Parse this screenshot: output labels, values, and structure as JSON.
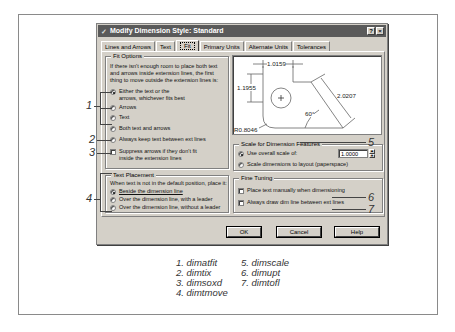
{
  "dialog": {
    "title": "Modify Dimension Style: Standard",
    "title_buttons": [
      "?",
      "×"
    ],
    "tabs": [
      {
        "label": "Lines and Arrows",
        "active": false
      },
      {
        "label": "Text",
        "active": false
      },
      {
        "label": "Fit",
        "active": true
      },
      {
        "label": "Primary Units",
        "active": false
      },
      {
        "label": "Alternate Units",
        "active": false
      },
      {
        "label": "Tolerances",
        "active": false
      }
    ],
    "fit_options": {
      "title": "Fit Options",
      "description": "If there isn't enough room to place both text and arrows inside extension lines, the first thing to move outside the extension lines is:",
      "radios": [
        {
          "label": "Either the text or the arrows, whichever fits best",
          "selected": true
        },
        {
          "label": "Arrows",
          "selected": false
        },
        {
          "label": "Text",
          "selected": false
        },
        {
          "label": "Both text and arrows",
          "selected": false
        },
        {
          "label": "Always keep text between ext lines",
          "selected": false
        }
      ],
      "checkbox": {
        "label": "Suppress arrows if they don't fit inside the extension lines",
        "checked": false
      }
    },
    "text_placement": {
      "title": "Text Placement",
      "description": "When text is not in the default position, place it:",
      "radios": [
        {
          "label": "Beside the dimension line",
          "selected": true
        },
        {
          "label": "Over the dimension line, with a leader",
          "selected": false
        },
        {
          "label": "Over the dimension line, without a leader",
          "selected": false
        }
      ]
    },
    "preview": {
      "labels": {
        "top": "1.0159",
        "left": "1.1955",
        "diag": "2.0207",
        "angle": "60°",
        "radius": "R0.8046"
      }
    },
    "scale": {
      "title": "Scale for Dimension Features",
      "radios": [
        {
          "label": "Use overall scale of:",
          "selected": true
        },
        {
          "label": "Scale dimensions to layout (paperspace)",
          "selected": false
        }
      ],
      "value": "1.0000"
    },
    "fine_tuning": {
      "title": "Fine Tuning",
      "checkboxes": [
        {
          "label": "Place text manually when dimensioning",
          "checked": false
        },
        {
          "label": "Always draw dim line between ext lines",
          "checked": false
        }
      ]
    },
    "buttons": {
      "ok": "OK",
      "cancel": "Cancel",
      "help": "Help"
    }
  },
  "callouts": [
    "1",
    "2",
    "3",
    "4",
    "5",
    "6",
    "7"
  ],
  "legend": {
    "col1": [
      "1. dimatfit",
      "2. dimtix",
      "3. dimsoxd",
      "4. dimtmove"
    ],
    "col2": [
      "5. dimscale",
      "6. dimupt",
      "7. dimtofl"
    ]
  }
}
